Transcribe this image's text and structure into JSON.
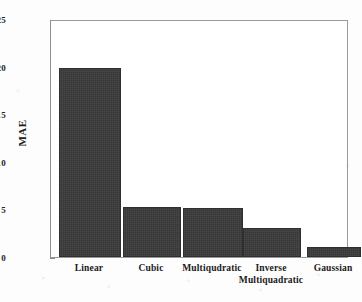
{
  "chart_data": {
    "type": "bar",
    "title": "",
    "subtitle": "",
    "xlabel": "",
    "ylabel": "MAE",
    "categories": [
      "Linear",
      "Cubic",
      "Multiqudratic",
      "Inverse\nMultiquadratic",
      "Gaussian"
    ],
    "values": [
      19.9,
      5.3,
      5.1,
      3.0,
      1.0
    ],
    "series": [
      {
        "name": "MAE",
        "values": [
          19.9,
          5.3,
          5.1,
          3.0,
          1.0
        ]
      }
    ],
    "ylim": [
      0,
      25
    ],
    "ytick_labels": [
      "25",
      "20",
      "15",
      "10",
      "5",
      "0"
    ],
    "ytick_values": [
      25,
      20,
      15,
      10,
      5,
      0
    ],
    "grid": false,
    "legend": false,
    "legend_position": "none",
    "bar_color": "#3a3a3a",
    "axis_color": "#8d8d8d",
    "background_color": "#ffffff",
    "annotations": []
  }
}
